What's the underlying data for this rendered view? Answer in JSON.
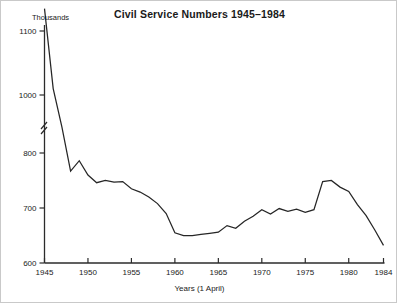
{
  "figure": {
    "background": "#ffffff",
    "line_color": "#262626",
    "axis_color": "#2b2b2b"
  },
  "chart_data": {
    "type": "line",
    "title": "Civil Service Numbers 1945–1984",
    "xlabel": "Years (1 April)",
    "ylabel": "Thousands",
    "grid": false,
    "legend": null,
    "axis_break": {
      "axis": "y",
      "between": [
        820,
        990
      ],
      "note": "zig-zag break drawn on the vertical axis"
    },
    "xlim": [
      1945,
      1984
    ],
    "ylim": [
      600,
      1135
    ],
    "xticks": [
      1945,
      1950,
      1955,
      1960,
      1965,
      1970,
      1975,
      1980,
      1984
    ],
    "xtick_labels": [
      "1945",
      "1950",
      "1955",
      "1960",
      "1965",
      "1970",
      "1975",
      "1980",
      "1984"
    ],
    "yticks": [
      600,
      700,
      800,
      1000,
      1100
    ],
    "ytick_labels": [
      "600",
      "700",
      "800",
      "1000",
      "1100"
    ],
    "x": [
      1945,
      1946,
      1947,
      1948,
      1949,
      1950,
      1951,
      1952,
      1953,
      1954,
      1955,
      1956,
      1957,
      1958,
      1959,
      1960,
      1961,
      1962,
      1963,
      1964,
      1965,
      1966,
      1967,
      1968,
      1969,
      1970,
      1971,
      1972,
      1973,
      1974,
      1975,
      1976,
      1977,
      1978,
      1979,
      1980,
      1981,
      1982,
      1983,
      1984
    ],
    "values": [
      1135,
      1010,
      890,
      767,
      786,
      760,
      746,
      750,
      747,
      748,
      735,
      729,
      720,
      708,
      690,
      655,
      650,
      650,
      652,
      654,
      656,
      668,
      663,
      676,
      685,
      697,
      689,
      699,
      694,
      698,
      692,
      697,
      748,
      750,
      738,
      730,
      706,
      686,
      660,
      632
    ],
    "series": [
      {
        "name": "Civil Service staff (thousands)",
        "values": [
          1135,
          1010,
          890,
          767,
          786,
          760,
          746,
          750,
          747,
          748,
          735,
          729,
          720,
          708,
          690,
          655,
          650,
          650,
          652,
          654,
          656,
          668,
          663,
          676,
          685,
          697,
          689,
          699,
          694,
          698,
          692,
          697,
          748,
          750,
          738,
          730,
          706,
          686,
          660,
          632
        ]
      }
    ]
  }
}
